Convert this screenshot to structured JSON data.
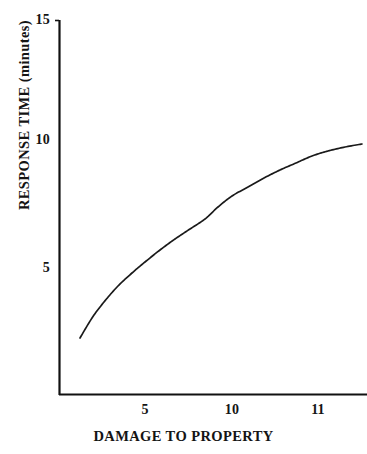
{
  "chart_data": {
    "type": "line",
    "title": "",
    "subtitle": "",
    "xlabel": "DAMAGE TO PROPERTY",
    "ylabel": "RESPONSE TIME (minutes)",
    "x_tick_labels": [
      "5",
      "10",
      "11"
    ],
    "x_tick_positions_px": [
      145,
      232,
      318
    ],
    "y_tick_labels": [
      "15",
      "10",
      "5"
    ],
    "y_tick_values": [
      15,
      10,
      5
    ],
    "ylim": [
      0,
      15
    ],
    "grid": false,
    "legend": null,
    "annotations": [],
    "series": [
      {
        "name": "response time vs damage",
        "color": "#1a1a1a",
        "x": [
          2.2,
          3.0,
          4.0,
          5.0,
          6.2,
          7.5,
          8.8,
          10.0,
          11.2,
          12.4,
          13.5,
          14.6
        ],
        "values": [
          2.2,
          3.4,
          4.4,
          5.2,
          6.0,
          6.7,
          7.3,
          7.8,
          8.3,
          8.8,
          9.3,
          9.8
        ]
      }
    ],
    "curve_points_px": [
      [
        80,
        338
      ],
      [
        92,
        318
      ],
      [
        104,
        302
      ],
      [
        118,
        286
      ],
      [
        132,
        273
      ],
      [
        145,
        262
      ],
      [
        160,
        250
      ],
      [
        175,
        239
      ],
      [
        190,
        229
      ],
      [
        205,
        219
      ],
      [
        218,
        207
      ],
      [
        232,
        196
      ],
      [
        248,
        187
      ],
      [
        264,
        178
      ],
      [
        280,
        170
      ],
      [
        296,
        163
      ],
      [
        312,
        156
      ],
      [
        328,
        151
      ],
      [
        345,
        147
      ],
      [
        362,
        144
      ]
    ]
  },
  "axes": {
    "y_axis_color": "#111111",
    "x_axis_color": "#111111",
    "axis_line_width_px": 2,
    "plot_origin_px": [
      59,
      395
    ],
    "plot_top_px": 20,
    "plot_right_px": 367
  },
  "canvas": {
    "background": "#ffffff",
    "width": 367,
    "height": 454
  }
}
